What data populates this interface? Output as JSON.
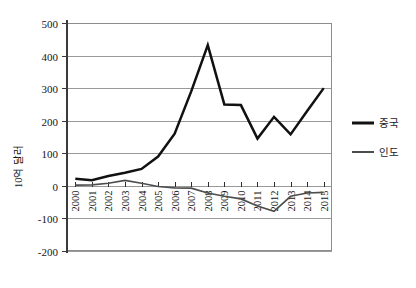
{
  "chart_data": {
    "type": "line",
    "title": "",
    "xlabel": "",
    "ylabel": "10억 달러",
    "x": [
      "2000",
      "2001",
      "2002",
      "2003",
      "2004",
      "2005",
      "2006",
      "2007",
      "2008",
      "2009",
      "2010",
      "2011",
      "2012",
      "2013",
      "2014",
      "2015"
    ],
    "categories": [
      "2000",
      "2001",
      "2002",
      "2003",
      "2004",
      "2005",
      "2006",
      "2007",
      "2008",
      "2009",
      "2010",
      "2011",
      "2012",
      "2013",
      "2014",
      "2015"
    ],
    "series": [
      {
        "name": "중국",
        "color": "#111111",
        "values": [
          22,
          17,
          30,
          40,
          52,
          90,
          160,
          290,
          432,
          250,
          248,
          145,
          212,
          158,
          230,
          300
        ]
      },
      {
        "name": "인도",
        "color": "#4d4d4d",
        "values": [
          2,
          3,
          8,
          17,
          8,
          -2,
          -6,
          -7,
          -22,
          -32,
          -40,
          -62,
          -78,
          -32,
          -22,
          -20
        ]
      }
    ],
    "ylim": [
      -200,
      500
    ],
    "yticks": [
      -200,
      -100,
      0,
      100,
      200,
      300,
      400,
      500
    ],
    "ytick_labels": [
      "-200",
      "-100",
      "0",
      "100",
      "200",
      "300",
      "400",
      "500"
    ],
    "grid": true,
    "grid_axis": "y",
    "legend_position": "right",
    "legend_entries": [
      "중국",
      "인도"
    ]
  },
  "legend": {
    "items": [
      {
        "label": "중국"
      },
      {
        "label": "인도"
      }
    ]
  },
  "axes": {
    "y_title": "10억 달러"
  }
}
